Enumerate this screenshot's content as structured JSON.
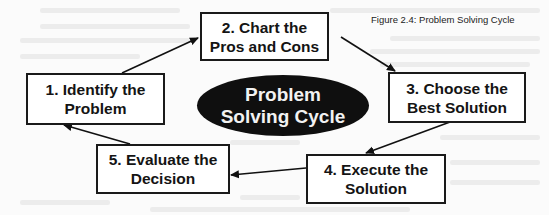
{
  "caption": "Figure 2.4: Problem Solving Cycle",
  "center": {
    "line1": "Problem",
    "line2": "Solving Cycle"
  },
  "steps": [
    {
      "number": 1,
      "line1": "1. Identify the",
      "line2": "Problem"
    },
    {
      "number": 2,
      "line1": "2. Chart the",
      "line2": "Pros and Cons"
    },
    {
      "number": 3,
      "line1": "3. Choose the",
      "line2": "Best Solution"
    },
    {
      "number": 4,
      "line1": "4. Execute the",
      "line2": "Solution"
    },
    {
      "number": 5,
      "line1": "5. Evaluate the",
      "line2": "Decision"
    }
  ],
  "flow": [
    "1 -> 2",
    "2 -> 3",
    "3 -> 4",
    "4 -> 5",
    "5 -> 1"
  ],
  "colors": {
    "box_border": "#1a1a1a",
    "box_fill": "#ffffff",
    "ellipse_fill": "#0f0f0f",
    "ellipse_text": "#f2f2f2",
    "arrow": "#111111"
  }
}
